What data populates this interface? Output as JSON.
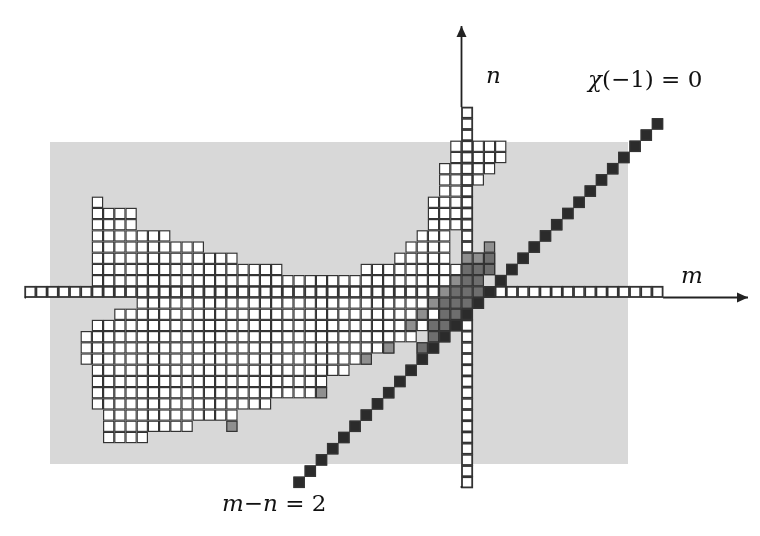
{
  "figure": {
    "name": "lattice-diagram-chi-minus-one",
    "background_color": "#ffffff",
    "shaded_region_color": "#d8d8d8",
    "cell_fill_white": "#ffffff",
    "cell_fill_black": "#2b2b2b",
    "cell_fill_gray_dark": "#6e6e6e",
    "cell_fill_gray_mid": "#8f8f8f",
    "cell_stroke": "#333333",
    "axis_color": "#222222"
  },
  "labels": {
    "n_axis": "n",
    "m_axis": "m",
    "chi_condition": "χ(−1) = 0",
    "chi_condition_parts": {
      "chi": "χ",
      "rest": "(−1) = 0"
    },
    "diagonal_condition": "m−n = 2",
    "diagonal_condition_parts": {
      "m": "m",
      "minus": "−",
      "n": "n",
      "rest": " = 2"
    }
  },
  "geometry": {
    "cell_size": 11.2,
    "origin_x": 461.5,
    "origin_y": 297.5,
    "shaded_rect": {
      "x": 50,
      "y": 142,
      "width": 578,
      "height": 322
    },
    "x_axis": {
      "x1": 26,
      "y1": 297.5,
      "x2": 748,
      "y2": 297.5,
      "arrow": "right"
    },
    "y_axis": {
      "x1": 461.5,
      "y1": 486,
      "x2": 461.5,
      "y2": 26,
      "arrow": "up"
    },
    "m_axis_cells": {
      "from_col": -39,
      "to_col": 17,
      "row": 0
    },
    "n_axis_cells": {
      "from_row": -17,
      "to_row": 16,
      "col": 0
    }
  },
  "chart_data": {
    "type": "heatmap",
    "title": "",
    "xlabel": "m",
    "ylabel": "n",
    "annotations": [
      "χ(−1) = 0",
      "m−n = 2"
    ],
    "legend": [
      {
        "label": "empty (shaded background)",
        "color": "#d8d8d8"
      },
      {
        "label": "white cell",
        "color": "#ffffff"
      },
      {
        "label": "mid gray cell",
        "color": "#8f8f8f"
      },
      {
        "label": "dark gray cell",
        "color": "#6e6e6e"
      },
      {
        "label": "black cell",
        "color": "#2b2b2b"
      }
    ],
    "grid": true,
    "axis_ranges": {
      "m": [
        -39,
        17
      ],
      "n": [
        -17,
        16
      ]
    },
    "black_diagonal_cells": [
      [
        -15,
        -17
      ],
      [
        -14,
        -16
      ],
      [
        -13,
        -15
      ],
      [
        -12,
        -14
      ],
      [
        -11,
        -13
      ],
      [
        -10,
        -12
      ],
      [
        -9,
        -11
      ],
      [
        -8,
        -10
      ],
      [
        -7,
        -9
      ],
      [
        -6,
        -8
      ],
      [
        -5,
        -7
      ],
      [
        -4,
        -6
      ],
      [
        -3,
        -5
      ],
      [
        -2,
        -4
      ],
      [
        -1,
        -3
      ],
      [
        0,
        -2
      ],
      [
        1,
        -1
      ],
      [
        2,
        0
      ],
      [
        3,
        1
      ],
      [
        4,
        2
      ],
      [
        5,
        3
      ],
      [
        6,
        4
      ],
      [
        7,
        5
      ],
      [
        8,
        6
      ],
      [
        9,
        7
      ],
      [
        10,
        8
      ],
      [
        11,
        9
      ],
      [
        12,
        10
      ],
      [
        13,
        11
      ],
      [
        14,
        12
      ],
      [
        15,
        13
      ],
      [
        16,
        14
      ],
      [
        17,
        15
      ]
    ],
    "dark_gray_cells": [
      [
        -1,
        -2
      ],
      [
        -1,
        -1
      ],
      [
        0,
        -1
      ],
      [
        0,
        0
      ],
      [
        1,
        0
      ],
      [
        1,
        1
      ],
      [
        0,
        1
      ],
      [
        -1,
        0
      ],
      [
        -2,
        -2
      ],
      [
        -2,
        -3
      ],
      [
        -3,
        -4
      ],
      [
        -2,
        -1
      ],
      [
        0,
        2
      ],
      [
        1,
        2
      ],
      [
        2,
        2
      ],
      [
        2,
        3
      ],
      [
        -3,
        -3
      ],
      [
        -4,
        -5
      ]
    ],
    "mid_gray_cells": [
      [
        -2,
        0
      ],
      [
        -3,
        -1
      ],
      [
        -4,
        -2
      ],
      [
        -1,
        1
      ],
      [
        0,
        3
      ],
      [
        1,
        3
      ],
      [
        -5,
        -3
      ],
      [
        -7,
        -5
      ],
      [
        -13,
        -9
      ],
      [
        -21,
        -12
      ],
      [
        2,
        4
      ],
      [
        -9,
        -6
      ]
    ],
    "white_region_rows": [
      {
        "n": 13,
        "m_from": -1,
        "m_to": 3
      },
      {
        "n": 12,
        "m_from": -1,
        "m_to": 3
      },
      {
        "n": 11,
        "m_from": -2,
        "m_to": 2
      },
      {
        "n": 10,
        "m_from": -2,
        "m_to": 1
      },
      {
        "n": 9,
        "m_from": -2,
        "m_to": 0
      },
      {
        "n": 8,
        "m_from": -3,
        "m_to": 0
      },
      {
        "n": 7,
        "m_from": -3,
        "m_to": -1
      },
      {
        "n": 6,
        "m_from": -3,
        "m_to": -1
      },
      {
        "n": 5,
        "m_from": -4,
        "m_to": -2
      },
      {
        "n": 4,
        "m_from": -5,
        "m_to": -2
      },
      {
        "n": 3,
        "m_from": -6,
        "m_to": -2
      },
      {
        "n": 2,
        "m_from": -9,
        "m_to": -1
      },
      {
        "n": 1,
        "m_from": -13,
        "m_to": -1
      },
      {
        "n": 0,
        "m_from": -39,
        "m_to": 17
      },
      {
        "n": -1,
        "m_from": -29,
        "m_to": -2
      },
      {
        "n": -2,
        "m_from": -31,
        "m_to": -3
      },
      {
        "n": -3,
        "m_from": -33,
        "m_to": -4
      },
      {
        "n": -4,
        "m_from": -34,
        "m_to": -5
      },
      {
        "n": -5,
        "m_from": -34,
        "m_to": -7
      },
      {
        "n": -6,
        "m_from": -34,
        "m_to": -9
      },
      {
        "n": -7,
        "m_from": -33,
        "m_to": -11
      },
      {
        "n": -8,
        "m_from": -33,
        "m_to": -13
      },
      {
        "n": -9,
        "m_from": -33,
        "m_to": -14
      },
      {
        "n": -10,
        "m_from": -33,
        "m_to": -18
      },
      {
        "n": -11,
        "m_from": -32,
        "m_to": -21
      },
      {
        "n": -12,
        "m_from": -32,
        "m_to": -25
      },
      {
        "n": -13,
        "m_from": -32,
        "m_to": -29
      }
    ],
    "white_upper_rows": [
      {
        "n": 5,
        "m_from": -33,
        "m_to": -27
      },
      {
        "n": 4,
        "m_from": -33,
        "m_to": -24
      },
      {
        "n": 3,
        "m_from": -33,
        "m_to": -21
      },
      {
        "n": 2,
        "m_from": -33,
        "m_to": -17
      },
      {
        "n": 1,
        "m_from": -33,
        "m_to": -14
      },
      {
        "n": 6,
        "m_from": -33,
        "m_to": -30
      },
      {
        "n": 7,
        "m_from": -33,
        "m_to": -30
      },
      {
        "n": 8,
        "m_from": -33,
        "m_to": -33
      }
    ]
  }
}
